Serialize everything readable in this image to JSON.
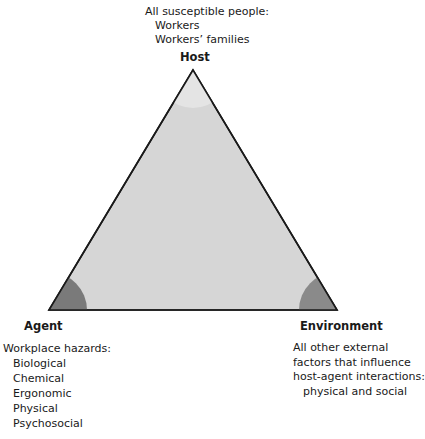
{
  "diagram": {
    "colors": {
      "triangle_fill": "#d6d6d6",
      "triangle_stroke": "#1a1a1a",
      "corner_agent": "#7a7a7a",
      "corner_environment": "#8a8a8a",
      "corner_host": "#e4e4e4"
    },
    "host": {
      "label": "Host",
      "heading": "All susceptible people:",
      "items": [
        "Workers",
        "Workers’ families"
      ]
    },
    "agent": {
      "label": "Agent",
      "heading": "Workplace hazards:",
      "items": [
        "Biological",
        "Chemical",
        "Ergonomic",
        "Physical",
        "Psychosocial"
      ]
    },
    "environment": {
      "label": "Environment",
      "lines": [
        "All other external",
        "factors that influence",
        "host-agent interactions:"
      ],
      "indented": "physical and social"
    }
  }
}
